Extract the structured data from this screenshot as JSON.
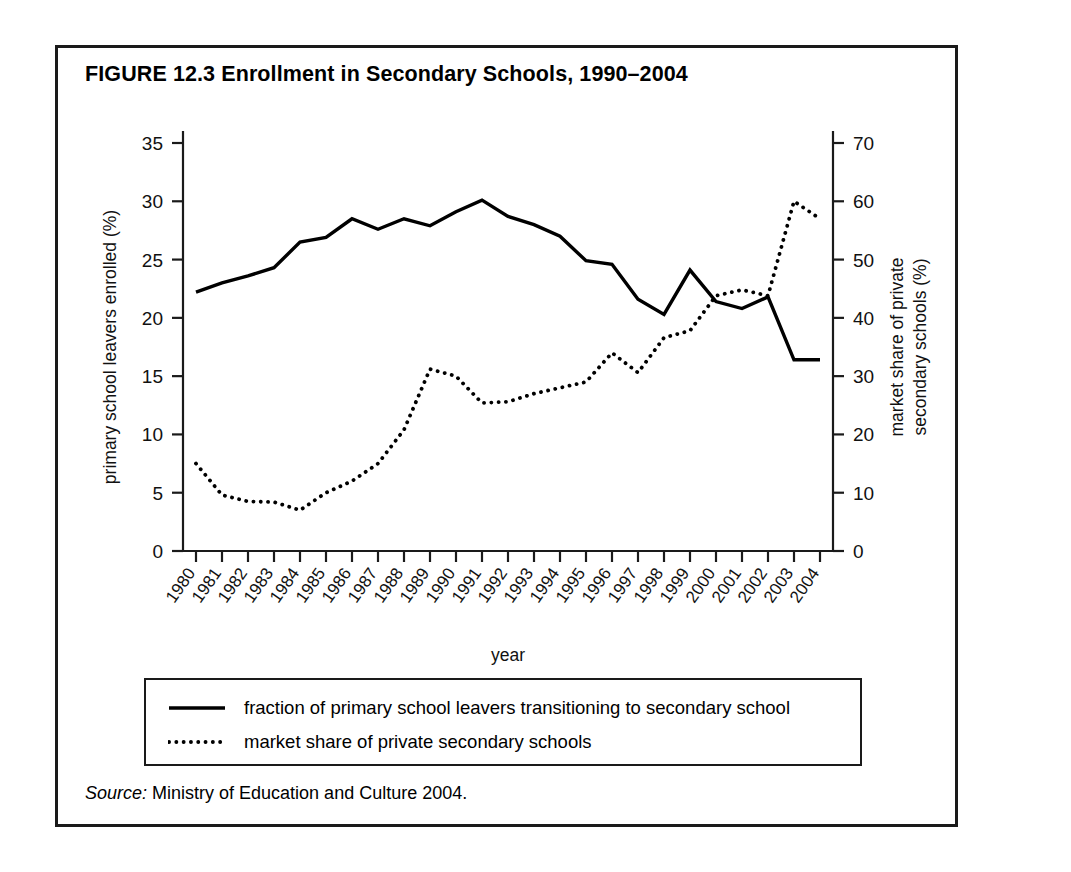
{
  "figure": {
    "title": "FIGURE 12.3  Enrollment in Secondary Schools, 1990–2004",
    "source_prefix": "Source:",
    "source_text": " Ministry of Education and Culture 2004."
  },
  "legend": {
    "items": [
      {
        "style": "solid",
        "label": "fraction of primary school leavers transitioning to secondary school"
      },
      {
        "style": "dotted",
        "label": "market share of private secondary schools"
      }
    ]
  },
  "chart_data": {
    "type": "line",
    "title": "FIGURE 12.3  Enrollment in Secondary Schools, 1990–2004",
    "xlabel": "year",
    "ylabel": "primary school leavers enrolled (%)",
    "ylabel_right": "market share of private secondary schools (%)",
    "grid": false,
    "legend_position": "bottom",
    "categories": [
      "1980",
      "1981",
      "1982",
      "1983",
      "1984",
      "1985",
      "1986",
      "1987",
      "1988",
      "1989",
      "1990",
      "1991",
      "1992",
      "1993",
      "1994",
      "1995",
      "1996",
      "1997",
      "1998",
      "1999",
      "2000",
      "2001",
      "2002",
      "2003",
      "2004"
    ],
    "x": [
      1980,
      1981,
      1982,
      1983,
      1984,
      1985,
      1986,
      1987,
      1988,
      1989,
      1990,
      1991,
      1992,
      1993,
      1994,
      1995,
      1996,
      1997,
      1998,
      1999,
      2000,
      2001,
      2002,
      2003,
      2004
    ],
    "ylim": [
      0,
      35
    ],
    "yticks": [
      0,
      5,
      10,
      15,
      20,
      25,
      30,
      35
    ],
    "ylim_right": [
      0,
      70
    ],
    "yticks_right": [
      0,
      10,
      20,
      30,
      40,
      50,
      60,
      70
    ],
    "series": [
      {
        "name": "fraction of primary school leavers transitioning to secondary school",
        "style": "solid",
        "axis": "left",
        "unit": "%",
        "values": [
          22.2,
          23.0,
          23.6,
          24.3,
          26.5,
          26.9,
          28.5,
          27.6,
          28.5,
          27.9,
          29.1,
          30.1,
          28.7,
          28.0,
          27.0,
          24.9,
          24.6,
          21.6,
          20.3,
          24.1,
          21.4,
          20.8,
          21.8,
          16.4,
          16.4
        ]
      },
      {
        "name": "market share of private secondary schools",
        "style": "dotted",
        "axis": "right",
        "unit": "%",
        "values": [
          15.0,
          9.6,
          8.5,
          8.4,
          7.0,
          10.0,
          12.0,
          15.0,
          20.8,
          31.2,
          30.0,
          25.4,
          25.6,
          27.0,
          28.0,
          29.0,
          34.0,
          30.6,
          36.6,
          37.8,
          43.8,
          44.8,
          43.8,
          60.0,
          57.0
        ]
      }
    ]
  }
}
